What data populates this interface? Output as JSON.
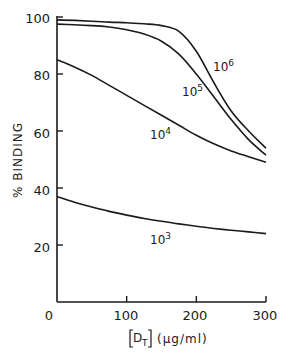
{
  "chart_data": {
    "type": "line",
    "title": "",
    "xlabel": "[D_T] (µg/ml)",
    "ylabel": "% BINDING",
    "xlim": [
      0,
      300
    ],
    "ylim": [
      0,
      100
    ],
    "x_ticks": [
      0,
      100,
      200,
      300
    ],
    "y_ticks": [
      20,
      40,
      60,
      80,
      100
    ],
    "grid": false,
    "legend": "inline curve labels",
    "x": [
      0,
      25,
      50,
      75,
      100,
      125,
      150,
      175,
      200,
      225,
      250,
      275,
      300
    ],
    "series": [
      {
        "name": "10^6",
        "label_base": "10",
        "label_exp": "6",
        "values": [
          99,
          98.8,
          98.5,
          98.2,
          98,
          97.6,
          97,
          95,
          88,
          77,
          67,
          60,
          54
        ]
      },
      {
        "name": "10^5",
        "label_base": "10",
        "label_exp": "5",
        "values": [
          97.5,
          97.3,
          97,
          96.5,
          95.5,
          94,
          91.5,
          87,
          80,
          72,
          64,
          57,
          51.5
        ]
      },
      {
        "name": "10^4",
        "label_base": "10",
        "label_exp": "4",
        "values": [
          85,
          82.5,
          79.5,
          76,
          72.5,
          69,
          65.5,
          62,
          58.5,
          55.5,
          53,
          51,
          49
        ]
      },
      {
        "name": "10^3",
        "label_base": "10",
        "label_exp": "3",
        "values": [
          37,
          35,
          33.3,
          31.8,
          30.5,
          29.3,
          28.3,
          27.4,
          26.6,
          25.8,
          25.2,
          24.6,
          24
        ]
      }
    ]
  },
  "axes": {
    "x_tick_labels": [
      "0",
      "100",
      "200",
      "300"
    ],
    "y_tick_labels": [
      "20",
      "40",
      "60",
      "80",
      "100"
    ],
    "x_title_bracket": "D",
    "x_title_sub": "T",
    "x_title_unit": "(µg/ml)",
    "y_title": "% BINDING"
  },
  "style": {
    "line_color": "#1a1a1a",
    "background": "#ffffff"
  }
}
